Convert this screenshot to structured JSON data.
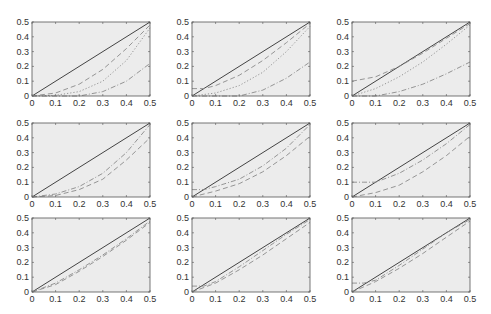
{
  "chart_data": [
    {
      "type": "line",
      "title": "",
      "xlabel": "",
      "ylabel": "",
      "xlim": [
        0,
        0.5
      ],
      "ylim": [
        0,
        0.5
      ],
      "xticks": [
        "0",
        "0.1",
        "0.2",
        "0.3",
        "0.4",
        "0.5"
      ],
      "yticks": [
        "0",
        "0.1",
        "0.2",
        "0.3",
        "0.4",
        "0.5"
      ],
      "series": [
        {
          "name": "solid",
          "style": "solid",
          "x": [
            0,
            0.5
          ],
          "y": [
            0,
            0.5
          ]
        },
        {
          "name": "dashed",
          "style": "dashed",
          "x": [
            0,
            0.1,
            0.2,
            0.3,
            0.4,
            0.5
          ],
          "y": [
            0,
            0.02,
            0.08,
            0.18,
            0.32,
            0.48
          ]
        },
        {
          "name": "dotted",
          "style": "dotted",
          "x": [
            0,
            0.1,
            0.2,
            0.3,
            0.4,
            0.5
          ],
          "y": [
            0,
            0.005,
            0.03,
            0.1,
            0.24,
            0.46
          ]
        },
        {
          "name": "dashdot",
          "style": "dashdot",
          "x": [
            0,
            0.2,
            0.3,
            0.4,
            0.5
          ],
          "y": [
            0,
            0.0,
            0.03,
            0.1,
            0.22
          ]
        }
      ]
    },
    {
      "type": "line",
      "title": "",
      "xlabel": "",
      "ylabel": "",
      "xlim": [
        0,
        0.5
      ],
      "ylim": [
        0,
        0.5
      ],
      "xticks": [
        "0",
        "0.1",
        "0.2",
        "0.3",
        "0.4",
        "0.5"
      ],
      "yticks": [
        "0",
        "0.1",
        "0.2",
        "0.3",
        "0.4",
        "0.5"
      ],
      "series": [
        {
          "name": "solid",
          "style": "solid",
          "x": [
            0,
            0.5
          ],
          "y": [
            0,
            0.5
          ]
        },
        {
          "name": "dashed",
          "style": "dashed",
          "x": [
            0,
            0.05,
            0.1,
            0.2,
            0.3,
            0.4,
            0.5
          ],
          "y": [
            0.05,
            0.05,
            0.07,
            0.14,
            0.24,
            0.36,
            0.49
          ]
        },
        {
          "name": "dotted",
          "style": "dotted",
          "x": [
            0,
            0.1,
            0.2,
            0.3,
            0.4,
            0.5
          ],
          "y": [
            0,
            0.02,
            0.07,
            0.16,
            0.3,
            0.47
          ]
        },
        {
          "name": "dashdot",
          "style": "dashdot",
          "x": [
            0,
            0.2,
            0.3,
            0.4,
            0.5
          ],
          "y": [
            0,
            0.0,
            0.04,
            0.12,
            0.23
          ]
        }
      ]
    },
    {
      "type": "line",
      "title": "",
      "xlabel": "",
      "ylabel": "",
      "xlim": [
        0,
        0.5
      ],
      "ylim": [
        0,
        0.5
      ],
      "xticks": [
        "0",
        "0.1",
        "0.2",
        "0.3",
        "0.4",
        "0.5"
      ],
      "yticks": [
        "0",
        "0.1",
        "0.2",
        "0.3",
        "0.4",
        "0.5"
      ],
      "series": [
        {
          "name": "solid",
          "style": "solid",
          "x": [
            0,
            0.5
          ],
          "y": [
            0,
            0.5
          ]
        },
        {
          "name": "dashed",
          "style": "dashed",
          "x": [
            0,
            0.1,
            0.2,
            0.3,
            0.4,
            0.5
          ],
          "y": [
            0.1,
            0.13,
            0.2,
            0.29,
            0.39,
            0.49
          ]
        },
        {
          "name": "dotted",
          "style": "dotted",
          "x": [
            0,
            0.1,
            0.2,
            0.3,
            0.4,
            0.5
          ],
          "y": [
            0,
            0.05,
            0.13,
            0.23,
            0.35,
            0.48
          ]
        },
        {
          "name": "dashdot",
          "style": "dashdot",
          "x": [
            0,
            0.1,
            0.2,
            0.3,
            0.4,
            0.5
          ],
          "y": [
            0,
            0.0,
            0.03,
            0.08,
            0.15,
            0.23
          ]
        }
      ]
    },
    {
      "type": "line",
      "title": "",
      "xlabel": "",
      "ylabel": "",
      "xlim": [
        0,
        0.5
      ],
      "ylim": [
        0,
        0.5
      ],
      "xticks": [
        "0",
        "0.1",
        "0.2",
        "0.3",
        "0.4",
        "0.5"
      ],
      "yticks": [
        "0",
        "0.1",
        "0.2",
        "0.3",
        "0.4",
        "0.5"
      ],
      "series": [
        {
          "name": "solid",
          "style": "solid",
          "x": [
            0,
            0.5
          ],
          "y": [
            0,
            0.5
          ]
        },
        {
          "name": "dashdot",
          "style": "dashdot",
          "x": [
            0,
            0.1,
            0.2,
            0.3,
            0.4,
            0.5
          ],
          "y": [
            0,
            0.02,
            0.07,
            0.16,
            0.3,
            0.49
          ]
        },
        {
          "name": "dashed",
          "style": "dashed",
          "x": [
            0,
            0.1,
            0.2,
            0.3,
            0.4,
            0.5
          ],
          "y": [
            0,
            0.01,
            0.05,
            0.12,
            0.25,
            0.4
          ]
        }
      ]
    },
    {
      "type": "line",
      "title": "",
      "xlabel": "",
      "ylabel": "",
      "xlim": [
        0,
        0.5
      ],
      "ylim": [
        0,
        0.5
      ],
      "xticks": [
        "0",
        "0.1",
        "0.2",
        "0.3",
        "0.4",
        "0.5"
      ],
      "yticks": [
        "0",
        "0.1",
        "0.2",
        "0.3",
        "0.4",
        "0.5"
      ],
      "series": [
        {
          "name": "solid",
          "style": "solid",
          "x": [
            0,
            0.5
          ],
          "y": [
            0,
            0.5
          ]
        },
        {
          "name": "dashdot",
          "style": "dashdot",
          "x": [
            0,
            0.05,
            0.1,
            0.2,
            0.3,
            0.4,
            0.5
          ],
          "y": [
            0.05,
            0.05,
            0.07,
            0.12,
            0.21,
            0.33,
            0.49
          ]
        },
        {
          "name": "dashed",
          "style": "dashed",
          "x": [
            0,
            0.1,
            0.2,
            0.3,
            0.4,
            0.5
          ],
          "y": [
            0,
            0.04,
            0.09,
            0.17,
            0.28,
            0.41
          ]
        }
      ]
    },
    {
      "type": "line",
      "title": "",
      "xlabel": "",
      "ylabel": "",
      "xlim": [
        0,
        0.5
      ],
      "ylim": [
        0,
        0.5
      ],
      "xticks": [
        "0",
        "0.1",
        "0.2",
        "0.3",
        "0.4",
        "0.5"
      ],
      "yticks": [
        "0",
        "0.1",
        "0.2",
        "0.3",
        "0.4",
        "0.5"
      ],
      "series": [
        {
          "name": "solid",
          "style": "solid",
          "x": [
            0,
            0.5
          ],
          "y": [
            0,
            0.5
          ]
        },
        {
          "name": "dashdot",
          "style": "dashdot",
          "x": [
            0,
            0.05,
            0.1,
            0.2,
            0.3,
            0.4,
            0.5
          ],
          "y": [
            0.1,
            0.1,
            0.1,
            0.16,
            0.25,
            0.36,
            0.49
          ]
        },
        {
          "name": "dashed",
          "style": "dashed",
          "x": [
            0,
            0.1,
            0.2,
            0.3,
            0.4,
            0.5
          ],
          "y": [
            0,
            0.03,
            0.08,
            0.17,
            0.28,
            0.41
          ]
        }
      ]
    },
    {
      "type": "line",
      "title": "",
      "xlabel": "",
      "ylabel": "",
      "xlim": [
        0,
        0.5
      ],
      "ylim": [
        0,
        0.5
      ],
      "xticks": [
        "0",
        "0.1",
        "0.2",
        "0.3",
        "0.4",
        "0.5"
      ],
      "yticks": [
        "0",
        "0.1",
        "0.2",
        "0.3",
        "0.4",
        "0.5"
      ],
      "series": [
        {
          "name": "solid",
          "style": "solid",
          "x": [
            0,
            0.5
          ],
          "y": [
            0,
            0.5
          ]
        },
        {
          "name": "dashdot",
          "style": "dashdot",
          "x": [
            0,
            0.1,
            0.2,
            0.3,
            0.4,
            0.5
          ],
          "y": [
            0,
            0.06,
            0.15,
            0.25,
            0.36,
            0.48
          ]
        },
        {
          "name": "dashed",
          "style": "dashed",
          "x": [
            0,
            0.1,
            0.2,
            0.3,
            0.4,
            0.5
          ],
          "y": [
            0,
            0.05,
            0.14,
            0.24,
            0.35,
            0.47
          ]
        }
      ]
    },
    {
      "type": "line",
      "title": "",
      "xlabel": "",
      "ylabel": "",
      "xlim": [
        0,
        0.5
      ],
      "ylim": [
        0,
        0.5
      ],
      "xticks": [
        "0",
        "0.1",
        "0.2",
        "0.3",
        "0.4",
        "0.5"
      ],
      "yticks": [
        "0",
        "0.1",
        "0.2",
        "0.3",
        "0.4",
        "0.5"
      ],
      "series": [
        {
          "name": "solid",
          "style": "solid",
          "x": [
            0,
            0.5
          ],
          "y": [
            0,
            0.5
          ]
        },
        {
          "name": "dashdot",
          "style": "dashdot",
          "x": [
            0,
            0.05,
            0.1,
            0.2,
            0.3,
            0.4,
            0.5
          ],
          "y": [
            0.04,
            0.04,
            0.07,
            0.17,
            0.28,
            0.39,
            0.49
          ]
        },
        {
          "name": "dashed",
          "style": "dashed",
          "x": [
            0,
            0.1,
            0.2,
            0.3,
            0.4,
            0.5
          ],
          "y": [
            0,
            0.06,
            0.15,
            0.25,
            0.36,
            0.47
          ]
        }
      ]
    },
    {
      "type": "line",
      "title": "",
      "xlabel": "",
      "ylabel": "",
      "xlim": [
        0,
        0.5
      ],
      "ylim": [
        0,
        0.5
      ],
      "xticks": [
        "0",
        "0.1",
        "0.2",
        "0.3",
        "0.4",
        "0.5"
      ],
      "yticks": [
        "0",
        "0.1",
        "0.2",
        "0.3",
        "0.4",
        "0.5"
      ],
      "series": [
        {
          "name": "solid",
          "style": "solid",
          "x": [
            0,
            0.5
          ],
          "y": [
            0,
            0.5
          ]
        },
        {
          "name": "dashdot",
          "style": "dashdot",
          "x": [
            0,
            0.05,
            0.1,
            0.2,
            0.3,
            0.4,
            0.5
          ],
          "y": [
            0.06,
            0.06,
            0.08,
            0.18,
            0.29,
            0.4,
            0.49
          ]
        },
        {
          "name": "dashed",
          "style": "dashed",
          "x": [
            0,
            0.1,
            0.2,
            0.3,
            0.4,
            0.5
          ],
          "y": [
            0,
            0.07,
            0.16,
            0.26,
            0.37,
            0.48
          ]
        }
      ]
    }
  ],
  "layout": {
    "cols_x": [
      32,
      192,
      352
    ],
    "rows_y": [
      22,
      123,
      218
    ],
    "plot_w": 118,
    "plot_h": 74,
    "colors": {
      "axes_bg": "#ececec",
      "line": "#444444",
      "faint": "#8a8a8a",
      "frame": "#555555"
    }
  }
}
